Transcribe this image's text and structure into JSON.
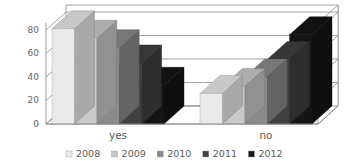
{
  "chart_data": {
    "type": "bar",
    "title": "",
    "subtitle": "",
    "xlabel": "",
    "ylabel": "",
    "categories": [
      "yes",
      "no"
    ],
    "series": [
      {
        "name": "2008",
        "color": "#e9e9e9",
        "values": [
          81,
          26
        ]
      },
      {
        "name": "2009",
        "color": "#c9c9c9",
        "values": [
          73,
          32
        ]
      },
      {
        "name": "2010",
        "color": "#8b8b8b",
        "values": [
          65,
          40
        ]
      },
      {
        "name": "2011",
        "color": "#404040",
        "values": [
          52,
          55
        ]
      },
      {
        "name": "2012",
        "color": "#151515",
        "values": [
          33,
          76
        ]
      }
    ],
    "ylim": [
      0,
      80
    ],
    "yticks": [
      0,
      20,
      40,
      60,
      80
    ],
    "ytick_labels": [
      "0",
      "20",
      "40",
      "60",
      "80"
    ],
    "grid": true,
    "grid_axis": "y",
    "legend_position": "bottom",
    "three_d": true,
    "annotations": []
  },
  "axis": {
    "y_tick_labels": [
      "80",
      "60",
      "40",
      "20",
      "0"
    ]
  },
  "categories": {
    "items": [
      {
        "label": "yes"
      },
      {
        "label": "no"
      }
    ]
  },
  "legend": {
    "items": [
      {
        "label": "2008",
        "color": "#e9e9e9"
      },
      {
        "label": "2009",
        "color": "#c9c9c9"
      },
      {
        "label": "2010",
        "color": "#8b8b8b"
      },
      {
        "label": "2011",
        "color": "#404040"
      },
      {
        "label": "2012",
        "color": "#151515"
      }
    ]
  }
}
